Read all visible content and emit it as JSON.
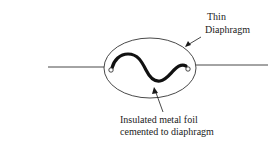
{
  "diagram": {
    "labels": {
      "diaphragm_line1": "Thin",
      "diaphragm_line2": "Diaphragm",
      "foil_line1": "Insulated metal foil",
      "foil_line2": "cemented to diaphragm"
    },
    "colors": {
      "stroke": "#1a1a1a",
      "background": "#ffffff"
    }
  }
}
